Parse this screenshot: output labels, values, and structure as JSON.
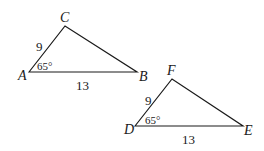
{
  "diagram": {
    "triangle1": {
      "vertices": {
        "A": "A",
        "B": "B",
        "C": "C"
      },
      "side_AC": "9",
      "side_AB": "13",
      "angle_A": "65°"
    },
    "triangle2": {
      "vertices": {
        "D": "D",
        "E": "E",
        "F": "F"
      },
      "side_DF": "9",
      "side_DE": "13",
      "angle_D": "65°"
    },
    "colors": {
      "stroke": "#1a1a1a",
      "background": "#ffffff"
    }
  }
}
